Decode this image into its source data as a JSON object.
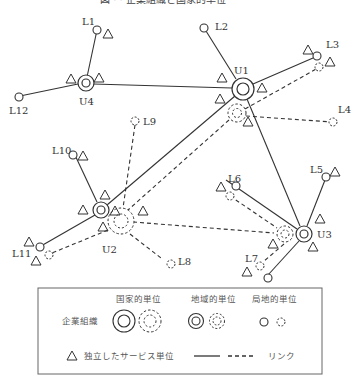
{
  "title": "図 · · 企業組織と国家的単位",
  "nodes": {
    "U1": {
      "label": "U1"
    },
    "U2": {
      "label": "U2"
    },
    "U3": {
      "label": "U3"
    },
    "U4": {
      "label": "U4"
    },
    "L1": {
      "label": "L1"
    },
    "L2": {
      "label": "L2"
    },
    "L3": {
      "label": "L3"
    },
    "L4": {
      "label": "L4"
    },
    "L5": {
      "label": "L5"
    },
    "L6": {
      "label": "L6"
    },
    "L7": {
      "label": "L7"
    },
    "L8": {
      "label": "L8"
    },
    "L9": {
      "label": "L9"
    },
    "L10": {
      "label": "L10"
    },
    "L11": {
      "label": "L11"
    },
    "L12": {
      "label": "L12"
    }
  },
  "legend": {
    "row_label": "企業組織",
    "national": "国家的単位",
    "regional": "地域的単位",
    "local": "局地的単位",
    "service_unit": "独立したサービス単位",
    "link": "リンク"
  },
  "colors": {
    "stroke": "#333333",
    "legend_border": "#666666",
    "background": "#ffffff"
  }
}
